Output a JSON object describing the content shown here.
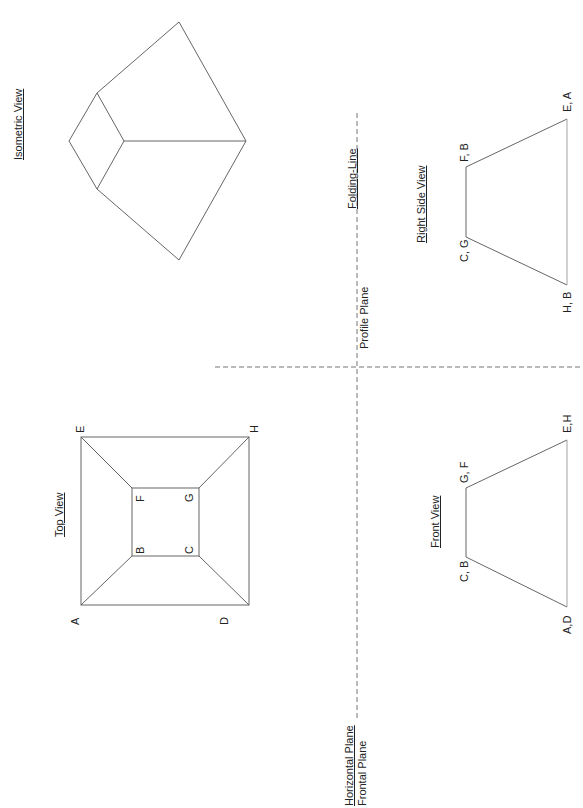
{
  "orientation": "rotated -90deg (landscape drawing shown in portrait)",
  "views": {
    "isometric": {
      "title": "Isometric View"
    },
    "top": {
      "title": "Top View",
      "points": {
        "A": "A",
        "B": "B",
        "C": "C",
        "D": "D",
        "E": "E",
        "F": "F",
        "G": "G",
        "H": "H"
      }
    },
    "front": {
      "title": "Front View",
      "labels": {
        "top_left": "C, B",
        "top_right": "G, F",
        "bottom_left": "A,D",
        "bottom_right": "E,H"
      }
    },
    "right_side": {
      "title": "Right Side View",
      "labels": {
        "top_left": "C, G",
        "top_right": "F, B",
        "bottom_left": "H, B",
        "bottom_right": "E, A"
      }
    }
  },
  "planes": {
    "folding_line": "Folding-Line",
    "profile_plane": "Profile Plane",
    "horizontal_plane": "Horizontal Plane",
    "frontal_plane": "Frontal Plane"
  },
  "colors": {
    "line": "#555555",
    "dash": "#777777",
    "text": "#222222"
  }
}
